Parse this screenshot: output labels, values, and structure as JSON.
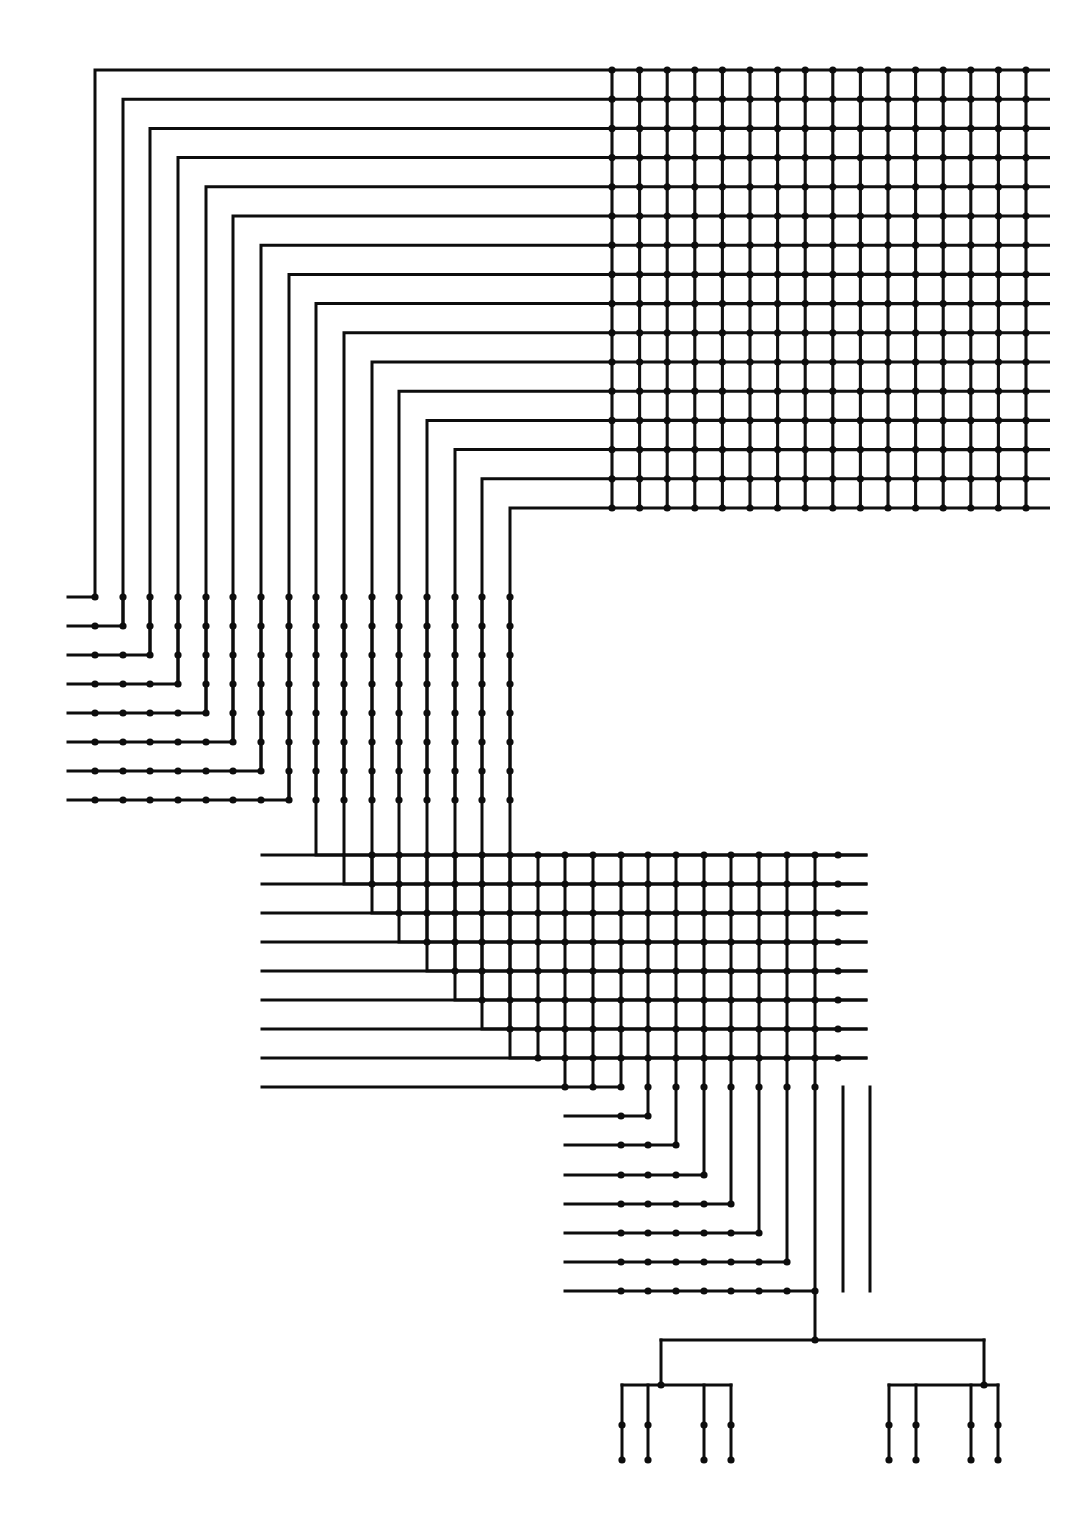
{
  "figure": {
    "title": "Recursive mesh interconnect routing diagram",
    "kind": "diagram",
    "canvas": {
      "width": 1078,
      "height": 1514
    },
    "ink_color": "#0d0d0d",
    "background_color": "#ffffff",
    "line_width": 3,
    "node_radius": 3.6
  },
  "geometry": {
    "grid_array": {
      "name": "top-right-mesh",
      "x0": 612,
      "y0": 70,
      "col_step": 27.6,
      "row_step": 29.2,
      "cols": 16,
      "rows": 16,
      "col_overrun_right": 24,
      "row_overrun_top": 0,
      "note": "Full crossbar mesh: every row/column intersection carries a via dot; horizontal rails overshoot the right-most column."
    },
    "bank_a": {
      "name": "upper-left-nest",
      "rows_y": [
        597,
        626,
        655,
        684,
        713,
        742,
        771,
        800
      ],
      "cols_x": [
        95,
        123,
        150,
        178,
        206,
        233,
        261,
        289,
        316,
        344,
        372,
        399,
        427,
        455,
        482,
        510
      ],
      "left_stub_x": 68,
      "corner_count": 16
    },
    "bank_b": {
      "name": "mid-nest",
      "rows_y": [
        855,
        884,
        913,
        942,
        971,
        1000,
        1029,
        1058,
        1087
      ],
      "cols_x": [
        344,
        372,
        399,
        427,
        455,
        482,
        510,
        538,
        565,
        593,
        621,
        648,
        676,
        704,
        731,
        759,
        787,
        815
      ],
      "left_stub_x": 262,
      "right_rail_x": 866
    },
    "bank_c": {
      "name": "lower-nest",
      "rows_y": [
        1087,
        1116,
        1145,
        1175,
        1204,
        1233,
        1262,
        1291
      ],
      "cols_x": [
        621,
        648,
        676,
        704,
        731,
        759,
        787,
        815,
        843,
        870
      ],
      "left_stub_x": 565
    },
    "h_tree": {
      "name": "bottom-fanout",
      "root_y": 1340,
      "trunk_x": 815,
      "branch_levels": 3,
      "leaf_count": 8,
      "leaf_y_top": 1425,
      "leaf_y_bottom": 1460,
      "leaf_x": [
        622,
        648,
        704,
        731,
        889,
        916,
        971,
        998
      ]
    }
  },
  "legend": {
    "node_label": "via / junction node",
    "wire_label": "routing channel"
  },
  "counts": {
    "grid_nodes": 256,
    "total_channels": 58,
    "terminal_pins": 8
  }
}
